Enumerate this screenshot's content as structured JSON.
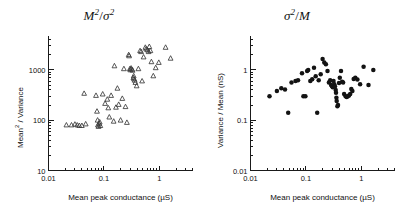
{
  "figure": {
    "background": "#ffffff",
    "marker_color_left": "#3a3a3a",
    "marker_color_right": "#131313",
    "axis_color": "#1a1a1a"
  },
  "panels": [
    {
      "id": "left",
      "title_main": "M",
      "title_sup1": "2",
      "title_slash": "/",
      "title_sym": "σ",
      "title_sup2": "2",
      "title_plain": "M²/σ²",
      "xlabel_text": "Mean peak conductance",
      "xlabel_units": "(µS)",
      "ylabel_base": "Mean",
      "ylabel_sup": "2",
      "ylabel_rest": " / Variance",
      "ylabel_plain": "Mean² / Variance",
      "xticks": [
        "0.01",
        "0.1",
        "1"
      ],
      "yticks": [
        "10",
        "100",
        "1000"
      ]
    },
    {
      "id": "right",
      "title_main": "σ",
      "title_sup1": "2",
      "title_slash": "/",
      "title_sym": "M",
      "title_sup2": "",
      "title_plain": "σ²/M",
      "xlabel_text": "Mean peak conductance",
      "xlabel_units": "(µS)",
      "ylabel_base": "Variance / Mean",
      "ylabel_sup": "",
      "ylabel_rest": "  (nS)",
      "ylabel_plain": "Variance / Mean  (nS)",
      "xticks": [
        "0.01",
        "0.1",
        "1"
      ],
      "yticks": [
        "0.01",
        "0.1",
        "1"
      ]
    }
  ],
  "chart_data": [
    {
      "type": "scatter",
      "panel": "left",
      "title": "M²/σ²",
      "xlabel": "Mean peak conductance (µS)",
      "ylabel": "Mean² / Variance",
      "xscale": "log",
      "yscale": "log",
      "xlim": [
        0.01,
        3.0
      ],
      "ylim": [
        10,
        4000
      ],
      "xticks": [
        0.01,
        0.1,
        1
      ],
      "yticks": [
        10,
        100,
        1000
      ],
      "grid": false,
      "legend": null,
      "marker": "triangle-open",
      "n_points": 62,
      "points": [
        [
          0.021,
          80
        ],
        [
          0.026,
          80
        ],
        [
          0.03,
          83
        ],
        [
          0.033,
          80
        ],
        [
          0.036,
          78
        ],
        [
          0.04,
          78
        ],
        [
          0.044,
          340
        ],
        [
          0.047,
          84
        ],
        [
          0.072,
          310
        ],
        [
          0.075,
          150
        ],
        [
          0.077,
          100
        ],
        [
          0.078,
          80
        ],
        [
          0.08,
          75
        ],
        [
          0.082,
          86
        ],
        [
          0.084,
          92
        ],
        [
          0.086,
          78
        ],
        [
          0.095,
          330
        ],
        [
          0.105,
          215
        ],
        [
          0.115,
          260
        ],
        [
          0.12,
          175
        ],
        [
          0.125,
          115
        ],
        [
          0.135,
          310
        ],
        [
          0.15,
          95
        ],
        [
          0.155,
          1200
        ],
        [
          0.165,
          180
        ],
        [
          0.175,
          430
        ],
        [
          0.185,
          205
        ],
        [
          0.2,
          100
        ],
        [
          0.215,
          270
        ],
        [
          0.23,
          1050
        ],
        [
          0.245,
          185
        ],
        [
          0.26,
          90
        ],
        [
          0.28,
          2000
        ],
        [
          0.285,
          1900
        ],
        [
          0.295,
          1050
        ],
        [
          0.3,
          1000
        ],
        [
          0.31,
          1080
        ],
        [
          0.32,
          1020
        ],
        [
          0.33,
          980
        ],
        [
          0.34,
          700
        ],
        [
          0.345,
          760
        ],
        [
          0.35,
          660
        ],
        [
          0.36,
          620
        ],
        [
          0.37,
          560
        ],
        [
          0.39,
          480
        ],
        [
          0.42,
          1050
        ],
        [
          0.45,
          2400
        ],
        [
          0.47,
          2300
        ],
        [
          0.49,
          600
        ],
        [
          0.52,
          1800
        ],
        [
          0.56,
          2800
        ],
        [
          0.58,
          2600
        ],
        [
          0.61,
          2500
        ],
        [
          0.64,
          2300
        ],
        [
          0.66,
          2900
        ],
        [
          0.69,
          2400
        ],
        [
          0.72,
          1450
        ],
        [
          0.78,
          760
        ],
        [
          0.86,
          1100
        ],
        [
          0.98,
          1400
        ],
        [
          1.3,
          2800
        ],
        [
          1.6,
          1700
        ]
      ]
    },
    {
      "type": "scatter",
      "panel": "right",
      "title": "σ²/M",
      "xlabel": "Mean peak conductance (µS)",
      "ylabel": "Variance / Mean (nS)",
      "xscale": "log",
      "yscale": "log",
      "xlim": [
        0.01,
        3.0
      ],
      "ylim": [
        0.01,
        3.0
      ],
      "xticks": [
        0.01,
        0.1,
        1
      ],
      "yticks": [
        0.01,
        0.1,
        1
      ],
      "grid": false,
      "legend": null,
      "marker": "circle-filled",
      "n_points": 58,
      "points": [
        [
          0.022,
          0.3
        ],
        [
          0.03,
          0.38
        ],
        [
          0.036,
          0.43
        ],
        [
          0.042,
          0.41
        ],
        [
          0.048,
          0.14
        ],
        [
          0.055,
          0.56
        ],
        [
          0.065,
          0.6
        ],
        [
          0.072,
          0.62
        ],
        [
          0.085,
          0.86
        ],
        [
          0.09,
          0.3
        ],
        [
          0.098,
          0.3
        ],
        [
          0.105,
          0.95
        ],
        [
          0.11,
          1.0
        ],
        [
          0.12,
          0.6
        ],
        [
          0.13,
          0.65
        ],
        [
          0.14,
          1.1
        ],
        [
          0.15,
          0.75
        ],
        [
          0.16,
          0.14
        ],
        [
          0.17,
          0.62
        ],
        [
          0.185,
          0.82
        ],
        [
          0.2,
          1.65
        ],
        [
          0.215,
          1.4
        ],
        [
          0.23,
          1.3
        ],
        [
          0.245,
          0.95
        ],
        [
          0.26,
          0.56
        ],
        [
          0.275,
          0.62
        ],
        [
          0.285,
          0.5
        ],
        [
          0.295,
          0.48
        ],
        [
          0.305,
          0.45
        ],
        [
          0.315,
          0.6
        ],
        [
          0.325,
          0.52
        ],
        [
          0.335,
          0.47
        ],
        [
          0.345,
          0.4
        ],
        [
          0.35,
          0.35
        ],
        [
          0.355,
          0.28
        ],
        [
          0.36,
          0.24
        ],
        [
          0.37,
          0.19
        ],
        [
          0.38,
          0.2
        ],
        [
          0.395,
          0.55
        ],
        [
          0.41,
          0.7
        ],
        [
          0.43,
          0.95
        ],
        [
          0.45,
          0.58
        ],
        [
          0.47,
          0.56
        ],
        [
          0.49,
          0.33
        ],
        [
          0.52,
          0.3
        ],
        [
          0.545,
          0.29
        ],
        [
          0.57,
          0.3
        ],
        [
          0.6,
          0.31
        ],
        [
          0.63,
          0.33
        ],
        [
          0.66,
          0.42
        ],
        [
          0.69,
          0.38
        ],
        [
          0.73,
          0.66
        ],
        [
          0.78,
          0.7
        ],
        [
          0.85,
          0.64
        ],
        [
          0.95,
          0.52
        ],
        [
          1.1,
          1.15
        ],
        [
          1.35,
          0.5
        ],
        [
          1.65,
          1.0
        ]
      ]
    }
  ]
}
